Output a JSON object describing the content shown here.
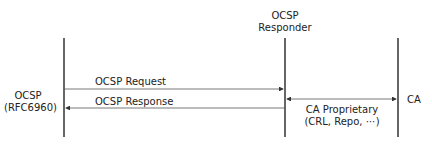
{
  "diagram": {
    "participants": [
      {
        "id": "client",
        "label_line1": "OCSP",
        "label_line2": "(RFC6960)"
      },
      {
        "id": "responder",
        "label_line1": "OCSP",
        "label_line2": "Responder"
      },
      {
        "id": "ca",
        "label_line1": "CA"
      }
    ],
    "messages": [
      {
        "from": "client",
        "to": "responder",
        "label": "OCSP Request"
      },
      {
        "from": "responder",
        "to": "client",
        "label": "OCSP Response"
      },
      {
        "from": "responder",
        "to": "ca",
        "bidirectional": true,
        "label_line1": "CA Proprietary",
        "label_line2": "(CRL, Repo, ⋯)"
      }
    ]
  }
}
